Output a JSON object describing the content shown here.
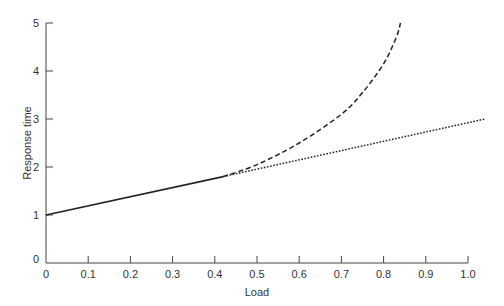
{
  "chart_data": {
    "type": "line",
    "title": "",
    "xlabel": "Load",
    "ylabel": "Response time",
    "xlim": [
      0,
      1.0
    ],
    "ylim": [
      0,
      5
    ],
    "x_ticks": [
      "0",
      "0.1",
      "0.2",
      "0.3",
      "0.4",
      "0.5",
      "0.6",
      "0.7",
      "0.8",
      "0.9",
      "1.0"
    ],
    "y_ticks": [
      "0",
      "1",
      "2",
      "3",
      "4",
      "5"
    ],
    "grid": false,
    "legend": null,
    "series": [
      {
        "name": "solid",
        "style": "solid",
        "x": [
          0,
          0.42
        ],
        "y": [
          1.0,
          1.8
        ]
      },
      {
        "name": "dotted",
        "style": "dotted",
        "x": [
          0.42,
          1.04
        ],
        "y": [
          1.8,
          3.0
        ]
      },
      {
        "name": "dashed",
        "style": "dashed",
        "x": [
          0.42,
          0.5,
          0.6,
          0.7,
          0.75,
          0.8,
          0.83,
          0.84
        ],
        "y": [
          1.8,
          2.05,
          2.5,
          3.1,
          3.55,
          4.15,
          4.7,
          5.0
        ]
      }
    ]
  }
}
